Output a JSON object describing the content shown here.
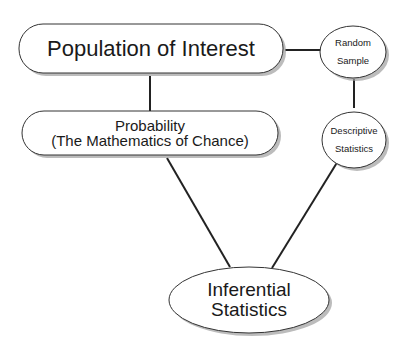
{
  "nodes": {
    "population": {
      "label": "Population of Interest"
    },
    "random_sample": {
      "line1": "Random",
      "line2": "Sample"
    },
    "probability": {
      "line1": "Probability",
      "line2": "(The Mathematics of Chance)"
    },
    "descriptive": {
      "line1": "Descriptive",
      "line2": "Statistics"
    },
    "inferential": {
      "line1": "Inferential",
      "line2": "Statistics"
    }
  },
  "colors": {
    "stroke": "#222222",
    "fill": "#ffffff",
    "shadow": "#9a9a9a"
  }
}
